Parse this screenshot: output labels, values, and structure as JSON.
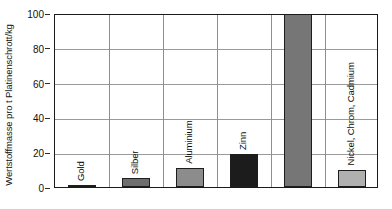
{
  "chart_data": {
    "type": "bar",
    "title": "",
    "subtitle": "",
    "xlabel": "",
    "ylabel": "Wertstoffmasse pro t Platinenschrott/kg",
    "ylim": [
      0,
      100
    ],
    "yticks": [
      0,
      20,
      40,
      60,
      80,
      100
    ],
    "ytick_labels": [
      "0",
      "20",
      "40",
      "60",
      "80",
      "100"
    ],
    "grid": "horizontal-and-vertical",
    "legend": "none",
    "categories": [
      "Gold",
      "Silber",
      "Aluminium",
      "Zinn",
      "Kupfer (max.)",
      "Nickel, Chrom, Cadmium"
    ],
    "values": [
      1,
      5,
      11,
      19,
      100,
      10
    ],
    "bar_colors": [
      "#c9c9c9",
      "#6e6e6e",
      "#8c8c8c",
      "#1c1c1c",
      "#767676",
      "#b0b0b0"
    ],
    "annotations": []
  },
  "axes": {
    "y_title": "Wertstoffmasse pro t Platinenschrott/kg"
  }
}
